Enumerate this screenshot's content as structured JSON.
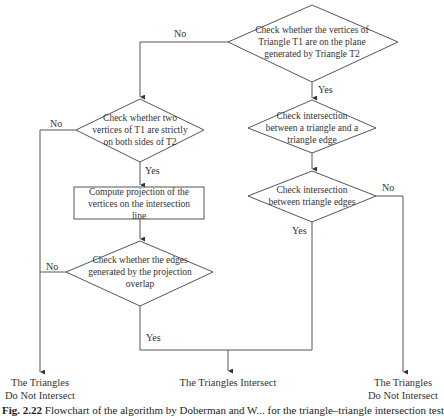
{
  "nodes": {
    "check_coplanar": {
      "type": "decision",
      "text_lines": [
        "Check whether the vertices of",
        "Triangle T1 are on the plane",
        "generated by Triangle T2"
      ]
    },
    "check_two_vertices": {
      "type": "decision",
      "text_lines": [
        "Check whether two",
        "vertices of T1 are strictly",
        "on both sides of T2"
      ]
    },
    "compute_projection": {
      "type": "process",
      "text_lines": [
        "Compute projection of the",
        "vertices on the intersection",
        "line"
      ]
    },
    "check_edges_overlap": {
      "type": "decision",
      "text_lines": [
        "Check whether the edges",
        "generated by the projection",
        "overlap"
      ]
    },
    "check_triangle_edge": {
      "type": "decision",
      "text_lines": [
        "Check intersection",
        "between a triangle and a",
        "triangle edge"
      ]
    },
    "check_triangle_edges": {
      "type": "decision",
      "text_lines": [
        "Check intersection",
        "between triangle edges"
      ]
    }
  },
  "terminals": {
    "left_no_intersect": {
      "lines": [
        "The Triangles",
        "Do Not Intersect"
      ]
    },
    "intersect": {
      "lines": [
        "The Triangles Intersect"
      ]
    },
    "right_no_intersect": {
      "lines": [
        "The Triangles",
        "Do Not Intersect"
      ]
    }
  },
  "edge_labels": {
    "coplanar_no": "No",
    "coplanar_yes": "Yes",
    "two_vertices_no": "No",
    "two_vertices_yes": "Yes",
    "overlap_no": "No",
    "overlap_yes": "Yes",
    "tri_edges_no": "No",
    "tri_edges_yes": "Yes"
  },
  "caption": {
    "label": "Fig. 2.22",
    "text": "Flowchart of the algorithm by Doberman and W... for the triangle–triangle intersection test"
  },
  "colors": {
    "stroke": "#555555",
    "text": "#333333",
    "background": "#ffffff"
  }
}
